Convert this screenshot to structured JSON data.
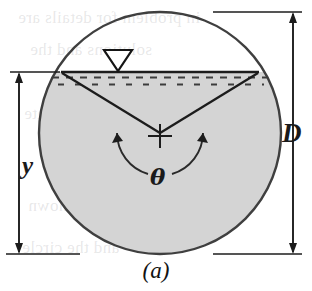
{
  "figure": {
    "caption": "(a)",
    "labels": {
      "diameter": "D",
      "depth": "y",
      "angle": "θ"
    },
    "icons": {
      "water_surface": "water-surface-triangle-icon",
      "center_mark": "center-cross-icon"
    },
    "colors": {
      "shaded_fill": "#d4d4d4",
      "outline": "#3a3a3a",
      "line": "#1c1c1c",
      "background": "#ffffff"
    }
  },
  "geometry": {
    "circle": {
      "cx": 160,
      "cy": 133,
      "r": 121
    },
    "water_line_y": 72,
    "chord_left_x": 62,
    "chord_right_x": 258,
    "triangle_marker_x": 118
  },
  "ghost_text": {
    "lines": [
      "in problem for details are",
      "solutions and the",
      "to appropriate",
      "value hence",
      "plotted shown",
      "and the circle"
    ]
  }
}
